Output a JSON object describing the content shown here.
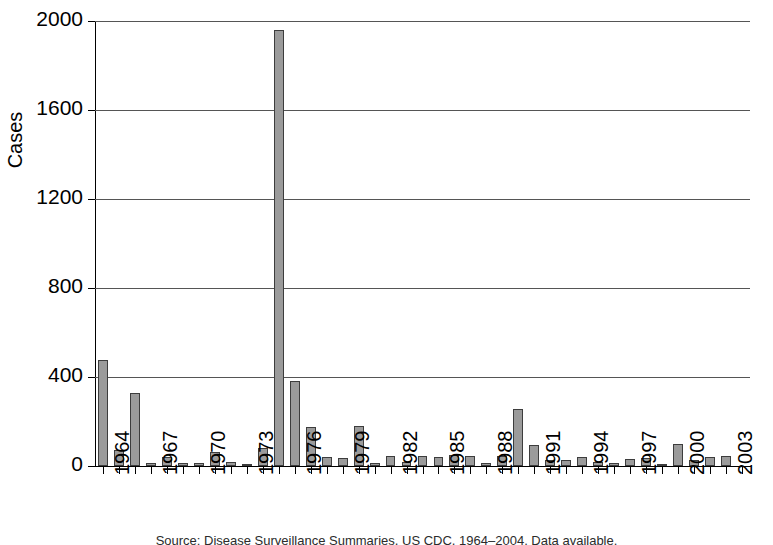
{
  "chart_data": {
    "type": "bar",
    "title": "",
    "xlabel": "",
    "ylabel": "Cases",
    "ylim": [
      0,
      2000
    ],
    "ytick_values": [
      0,
      400,
      800,
      1200,
      1600,
      2000
    ],
    "ytick_labels": [
      "0",
      "400",
      "800",
      "1200",
      "1600",
      "2000"
    ],
    "grid": true,
    "legend": "none",
    "xtick_step": 3,
    "xtick_labels": [
      "1964",
      "1967",
      "1970",
      "1973",
      "1976",
      "1979",
      "1982",
      "1985",
      "1988",
      "1991",
      "1994",
      "1997",
      "2000",
      "2003"
    ],
    "categories": [
      "1964",
      "1965",
      "1966",
      "1967",
      "1968",
      "1969",
      "1970",
      "1971",
      "1972",
      "1973",
      "1974",
      "1975",
      "1976",
      "1977",
      "1978",
      "1979",
      "1980",
      "1981",
      "1982",
      "1983",
      "1984",
      "1985",
      "1986",
      "1987",
      "1988",
      "1989",
      "1990",
      "1991",
      "1992",
      "1993",
      "1994",
      "1995",
      "1996",
      "1997",
      "1998",
      "1999",
      "2000",
      "2001",
      "2002",
      "2003",
      "2004"
    ],
    "values": [
      475,
      70,
      330,
      15,
      40,
      15,
      15,
      65,
      20,
      10,
      80,
      1960,
      380,
      175,
      40,
      35,
      180,
      15,
      45,
      20,
      45,
      40,
      50,
      45,
      15,
      45,
      255,
      95,
      25,
      25,
      40,
      20,
      15,
      30,
      35,
      5,
      100,
      25,
      40,
      45,
      0
    ]
  },
  "caption": {
    "text": "Source: Disease Surveillance Summaries, US CDC, 1964–2004. Data available."
  }
}
